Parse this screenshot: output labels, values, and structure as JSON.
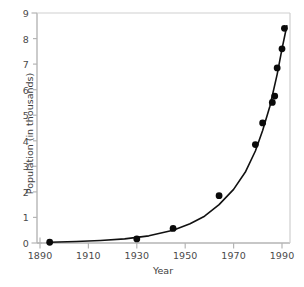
{
  "chart_data": {
    "type": "scatter",
    "title": "",
    "subtitle": "",
    "xlabel": "Year",
    "ylabel": "Population (in thousands)",
    "xlim": [
      1890,
      2000
    ],
    "ylim": [
      0,
      9
    ],
    "xticks": [
      1890,
      1910,
      1930,
      1950,
      1970,
      1990
    ],
    "xtick_labels": [
      "1890",
      "1910",
      "1930",
      "1950",
      "1970",
      "1990"
    ],
    "yticks": [
      0,
      1,
      2,
      3,
      4,
      5,
      6,
      7,
      8,
      9
    ],
    "ytick_labels": [
      "0",
      "1",
      "2",
      "3",
      "4",
      "5",
      "6",
      "7",
      "8",
      "9"
    ],
    "grid": false,
    "legend": "none",
    "marker_color": "#000000",
    "line_color": "#000000",
    "axis_color": "#b0b0b0",
    "background_color": "#ffffff",
    "series": [
      {
        "name": "Population",
        "marker": "filled-circle",
        "x": [
          1894,
          1930,
          1945,
          1964,
          1979,
          1982,
          1986,
          1987,
          1988,
          1990,
          1991
        ],
        "y": [
          0.03,
          0.16,
          0.57,
          1.85,
          3.85,
          4.7,
          5.5,
          5.75,
          6.85,
          7.6,
          8.4
        ]
      },
      {
        "name": "Fitted exponential curve",
        "type": "line",
        "x": [
          1894,
          1905,
          1915,
          1925,
          1935,
          1945,
          1952,
          1958,
          1964,
          1970,
          1975,
          1979,
          1982,
          1985,
          1988,
          1990,
          1992
        ],
        "y": [
          0.03,
          0.06,
          0.1,
          0.16,
          0.28,
          0.5,
          0.75,
          1.05,
          1.5,
          2.1,
          2.8,
          3.6,
          4.4,
          5.35,
          6.6,
          7.6,
          8.5
        ]
      }
    ]
  },
  "figure": {
    "axes_label_xlabel": "Year",
    "axes_label_ylabel": "Population (in thousands)"
  }
}
